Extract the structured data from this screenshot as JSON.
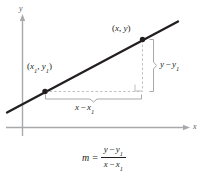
{
  "figure": {
    "background": "#ffffff",
    "line_color": "#231f20",
    "axis_color": "#a7a9ac",
    "dashed_color": "#bcbec0",
    "bracket_color": "#a7a9ac",
    "text_color": "#231f20"
  },
  "axes": {
    "x_label": "x",
    "y_label": "y"
  },
  "points": [
    {
      "name": "point-1",
      "label_open": "(",
      "var_x": "x",
      "sub_x": "1",
      "comma": ", ",
      "var_y": "y",
      "sub_y": "1",
      "label_close": ")"
    },
    {
      "name": "point-2",
      "label_open": "(",
      "var_x": "x",
      "comma": ", ",
      "var_y": "y",
      "label_close": ")"
    }
  ],
  "segments": {
    "rise": {
      "var_a": "y",
      "op": "−",
      "var_b": "y",
      "sub_b": "1"
    },
    "run": {
      "var_a": "x",
      "op": "−",
      "var_b": "x",
      "sub_b": "1"
    }
  },
  "formula": {
    "slope_symbol": "m",
    "equals": "=",
    "numerator": {
      "var_a": "y",
      "op": "−",
      "var_b": "y",
      "sub_b": "1"
    },
    "denominator": {
      "var_a": "x",
      "op": "−",
      "var_b": "x",
      "sub_b": "1"
    }
  }
}
